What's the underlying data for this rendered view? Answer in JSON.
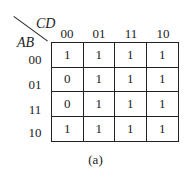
{
  "kmap": {
    "row_var": "AB",
    "col_var": "CD",
    "col_headers": [
      "00",
      "01",
      "11",
      "10"
    ],
    "row_headers": [
      "00",
      "01",
      "11",
      "10"
    ],
    "cells": [
      [
        "1",
        "1",
        "1",
        "1"
      ],
      [
        "0",
        "1",
        "1",
        "1"
      ],
      [
        "0",
        "1",
        "1",
        "1"
      ],
      [
        "1",
        "1",
        "1",
        "1"
      ]
    ]
  },
  "caption": "(a)"
}
